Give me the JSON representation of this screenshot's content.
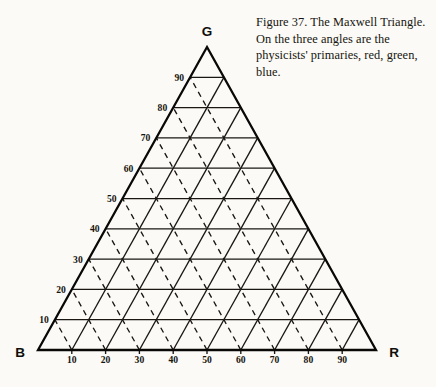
{
  "figure": {
    "caption": "Figure 37. The Maxwell Triangle. On the three angles are the physicists' primaries, red, green, blue.",
    "caption_lines": [
      "Figure 37. The Maxwell",
      "Triangle. On the three",
      "angles are the physicists'",
      "primaries, red, green, blue."
    ],
    "background_color": "#fbfaf6",
    "ink_color": "#16140f"
  },
  "chart_data": {
    "type": "ternary-grid",
    "title": "The Maxwell Triangle",
    "vertices": [
      {
        "id": "apex",
        "label": "G",
        "meaning": "green",
        "x": 207,
        "y": 47
      },
      {
        "id": "bottom-left",
        "label": "B",
        "meaning": "blue",
        "x": 38,
        "y": 350
      },
      {
        "id": "bottom-right",
        "label": "R",
        "meaning": "red",
        "x": 376,
        "y": 350
      }
    ],
    "vertex_label_positions": {
      "G": {
        "x": 207,
        "y": 36
      },
      "B": {
        "x": 20,
        "y": 357
      },
      "R": {
        "x": 394,
        "y": 357
      }
    },
    "gridlines": {
      "count_per_family": 9,
      "interval": 10,
      "horizontal_style": "solid",
      "parallel_to_left_edge_style": "solid",
      "parallel_to_right_edge_style": "dashed"
    },
    "axes": [
      {
        "id": "bottom-axis",
        "orientation": "horizontal",
        "from_label": "B",
        "to_label": "R",
        "ticks": [
          10,
          20,
          30,
          40,
          50,
          60,
          70,
          80,
          90
        ],
        "tick_label_side": "below"
      },
      {
        "id": "left-axis",
        "orientation": "left-edge",
        "from_label": "B",
        "to_label": "G",
        "ticks": [
          10,
          20,
          30,
          40,
          50,
          60,
          70,
          80,
          90
        ],
        "tick_label_side": "outside-left"
      }
    ],
    "scale_min": 0,
    "scale_max": 100,
    "tick_step": 10
  }
}
